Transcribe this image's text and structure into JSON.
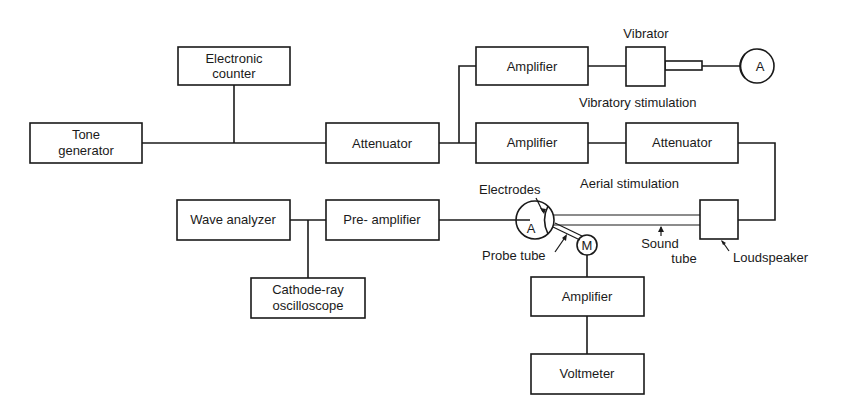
{
  "diagram": {
    "blocks": {
      "tone_generator": [
        "Tone",
        "generator"
      ],
      "electronic_counter": [
        "Electronic",
        "counter"
      ],
      "attenuator_main": "Attenuator",
      "amplifier_vibratory": "Amplifier",
      "amplifier_aerial": "Amplifier",
      "attenuator_aerial": "Attenuator",
      "wave_analyzer": "Wave analyzer",
      "pre_amplifier": "Pre- amplifier",
      "oscilloscope": [
        "Cathode-ray",
        "oscilloscope"
      ],
      "amplifier_microphone": "Amplifier",
      "voltmeter": "Voltmeter",
      "loudspeaker_box": ""
    },
    "labels": {
      "vibrator": "Vibrator",
      "vibratory_stimulation": "Vibratory stimulation",
      "aerial_stimulation": "Aerial stimulation",
      "electrodes": "Electrodes",
      "probe_tube": "Probe tube",
      "sound_tube": [
        "Sound",
        "tube"
      ],
      "loudspeaker": "Loudspeaker"
    },
    "symbols": {
      "animal_vibratory": "A",
      "animal_aerial": "A",
      "microphone": "M"
    }
  }
}
